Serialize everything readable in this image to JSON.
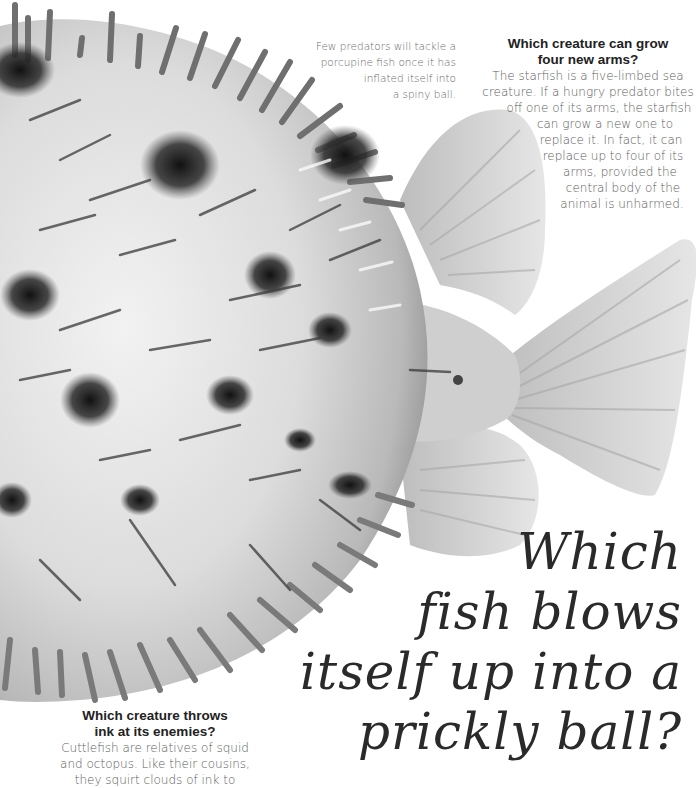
{
  "page": {
    "background": "#ffffff",
    "illustration": {
      "subject": "porcupine-fish",
      "description": "Inflated porcupine fish with spines, grayscale illustration, dorsal/anal fins and tail fin on right",
      "colors": {
        "body_light": "#e2e2e2",
        "body_mid": "#bdbdbd",
        "spots_dark": "#1a1a1a",
        "fin": "#d6d6d6"
      }
    }
  },
  "caption": {
    "lines": [
      "Few predators will tackle a",
      "porcupine fish once it has",
      "inflated itself into",
      "a spiny ball."
    ]
  },
  "qa_starfish": {
    "title_lines": [
      "Which creature can grow",
      "four new arms?"
    ],
    "body_lines": [
      "The starfish is a five-limbed sea",
      "creature. If a hungry predator bites",
      "off one of its arms, the starfish",
      "can grow a new one to",
      "replace it. In fact, it can",
      "replace up to four of its",
      "arms, provided the",
      "central body of the",
      "animal is unharmed."
    ]
  },
  "main_title": {
    "lines": [
      "Which",
      "fish blows",
      "itself up into a",
      "prickly ball?"
    ]
  },
  "qa_cuttlefish": {
    "title_lines": [
      "Which creature throws",
      "ink at its enemies?"
    ],
    "body_lines": [
      "Cuttlefish are relatives of squid",
      "and octopus. Like their cousins,",
      "they squirt clouds of ink to"
    ]
  }
}
